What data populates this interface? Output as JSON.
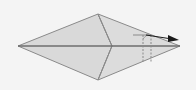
{
  "diagram": {
    "type": "origami-fold-step",
    "background": "#f4f4f4",
    "paper_fill": "#d9d9d9",
    "paper_fill_right": "#dcdcdc",
    "line_color": "#8a8a8a",
    "centerline_color": "#6e6e6e",
    "arrow_color": "#1a1a1a",
    "vertices": {
      "left": [
        18,
        46
      ],
      "top": [
        98,
        14
      ],
      "right": [
        180,
        46
      ],
      "bottom": [
        98,
        80
      ],
      "inner": [
        112,
        46
      ]
    },
    "dashed_lines": [
      {
        "x1": 143,
        "y1": 35,
        "x2": 143,
        "y2": 62
      },
      {
        "x1": 151,
        "y1": 35,
        "x2": 151,
        "y2": 62
      }
    ],
    "guide_line": {
      "x1": 133,
      "y1": 35,
      "x2": 151,
      "y2": 35
    },
    "arrow": {
      "x1": 146,
      "y1": 35,
      "x2": 178,
      "y2": 40
    }
  }
}
